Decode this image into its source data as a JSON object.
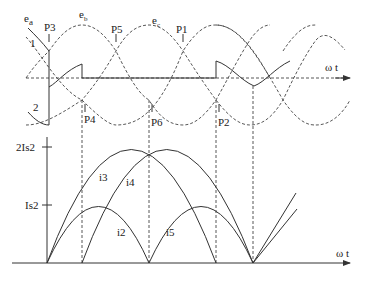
{
  "top_panel": {
    "axis_label": "ω t",
    "phase_labels": {
      "ea": "e",
      "ea_sub": "a",
      "eb": "e",
      "eb_sub": "b",
      "ec": "e",
      "ec_sub": "c"
    },
    "curve_labels": {
      "one": "1",
      "two": "2"
    },
    "points": {
      "p1": "P1",
      "p2": "P2",
      "p3": "P3",
      "p4": "P4",
      "p5": "P5",
      "p6": "P6"
    }
  },
  "bottom_panel": {
    "axis_label": "ω t",
    "y_ticks": {
      "high": "2Is2",
      "low": "Is2"
    },
    "current_labels": {
      "i2": "i2",
      "i3": "i3",
      "i4": "i4",
      "i5": "i5"
    }
  },
  "colors": {
    "line": "#333333",
    "background": "#ffffff"
  }
}
